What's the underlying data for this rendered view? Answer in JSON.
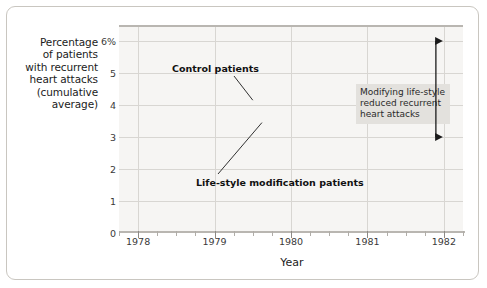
{
  "chart_data": {
    "type": "line",
    "title": "",
    "xlabel": "Year",
    "ylabel": "Percentage of patients with recurrent heart attacks (cumulative average)",
    "ylabel_lines": [
      "Percentage",
      "of patients",
      "with recurrent",
      "heart attacks",
      "(cumulative",
      "average)"
    ],
    "xlim": [
      1977.75,
      1982.25
    ],
    "ylim": [
      0,
      6.5
    ],
    "grid": true,
    "legend_position": "inline-annotations",
    "y_ticks": [
      {
        "value": 6,
        "label": "6%"
      },
      {
        "value": 5,
        "label": "5"
      },
      {
        "value": 4,
        "label": "4"
      },
      {
        "value": 3,
        "label": "3"
      },
      {
        "value": 2,
        "label": "2"
      },
      {
        "value": 1,
        "label": "1"
      },
      {
        "value": 0,
        "label": "0"
      }
    ],
    "x_ticks": [
      {
        "value": 1978,
        "label": "1978"
      },
      {
        "value": 1979,
        "label": "1979"
      },
      {
        "value": 1980,
        "label": "1980"
      },
      {
        "value": 1981,
        "label": "1981"
      },
      {
        "value": 1982,
        "label": "1982"
      }
    ],
    "x_minor_interval": 0.25,
    "x": [
      1977.88,
      1978.0,
      1978.12,
      1978.37,
      1978.62,
      1978.88,
      1979.0,
      1979.25,
      1979.5,
      1979.75,
      1980.0,
      1980.25,
      1980.5,
      1980.75,
      1981.0,
      1981.25,
      1981.5,
      1981.75,
      1982.0
    ],
    "series": [
      {
        "name": "Control patients",
        "color": "#9a9893",
        "values": [
          3.2,
          2.55,
          1.65,
          2.5,
          3.25,
          3.9,
          3.1,
          3.45,
          4.15,
          4.75,
          4.7,
          4.55,
          4.3,
          5.3,
          6.0,
          5.85,
          5.95,
          6.05,
          6.15
        ]
      },
      {
        "name": "Life-style modification patients",
        "color": "#bdbbb6",
        "values": [
          3.25,
          2.9,
          2.85,
          3.15,
          3.5,
          3.1,
          3.35,
          3.45,
          3.45,
          3.6,
          3.4,
          3.05,
          2.88,
          2.9,
          3.02,
          2.95,
          2.72,
          2.82,
          3.0
        ]
      }
    ],
    "annotations": [
      {
        "name": "control-patients-label",
        "text": "Control patients",
        "points_to": [
          1979.5,
          4.15
        ]
      },
      {
        "name": "life-style-label",
        "text": "Life-style modification patients",
        "points_to": [
          1979.62,
          3.45
        ]
      },
      {
        "name": "callout-box",
        "text_lines": [
          "Modifying life-style",
          "reduced recurrent",
          "heart attacks"
        ],
        "text": "Modifying life-style reduced recurrent heart attacks"
      },
      {
        "name": "gap-arrow",
        "type": "double-headed-arrow",
        "from_value": 6.0,
        "to_value": 3.0,
        "at_x": 1982.0
      }
    ]
  },
  "figure": {
    "background": "#ffffff",
    "plot_background": "#f6f5f3",
    "grid_color": "#d8d6d2",
    "axis_color": "#b9b6b1",
    "border_color": "#c9c6c0",
    "text_color": "#1b1b1b",
    "callout_background": "#e3e1dd"
  }
}
